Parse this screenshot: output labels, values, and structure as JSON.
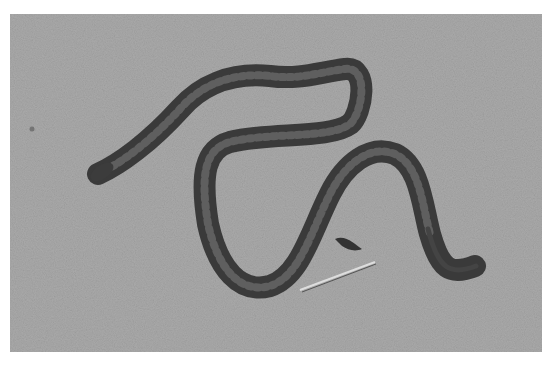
{
  "image": {
    "subject": "snake on sand",
    "colors": {
      "sand": "#a9a9a9",
      "snake_body": "#3a3a3a",
      "snake_back": "#8a8a8a",
      "page_background": "#ffffff"
    }
  },
  "caption": {
    "text": "",
    "truncated": true
  }
}
